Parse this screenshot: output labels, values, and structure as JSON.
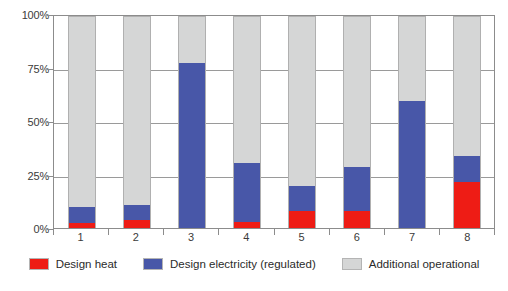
{
  "chart_data": {
    "type": "bar",
    "stacked": true,
    "title": "",
    "subtitle": "",
    "xlabel": "",
    "ylabel": "",
    "categories": [
      "1",
      "2",
      "3",
      "4",
      "5",
      "6",
      "7",
      "8"
    ],
    "ylim": [
      0,
      100
    ],
    "ytick_labels": [
      "0%",
      "25%",
      "50%",
      "75%",
      "100%"
    ],
    "ytick_values": [
      0,
      25,
      50,
      75,
      100
    ],
    "grid": true,
    "grid_axis": "y",
    "legend_position": "bottom",
    "series": [
      {
        "name": "Design heat",
        "color": "#ee1c15",
        "values": [
          2.5,
          4.0,
          0.0,
          3.0,
          8.0,
          8.0,
          0.0,
          22.0
        ]
      },
      {
        "name": "Design electricity (regulated)",
        "color": "#4857a8",
        "values": [
          7.5,
          7.0,
          78.0,
          28.0,
          12.0,
          21.0,
          60.0,
          12.0
        ]
      },
      {
        "name": "Additional operational",
        "color": "#d5d6d6",
        "values": [
          90.0,
          89.0,
          22.0,
          69.0,
          80.0,
          71.0,
          40.0,
          66.0
        ]
      }
    ],
    "cumulative_tops": {
      "design_heat": [
        2.5,
        4.0,
        0.0,
        3.0,
        8.0,
        8.0,
        0.0,
        22.0
      ],
      "design_electricity": [
        10.0,
        11.0,
        78.0,
        31.0,
        20.0,
        29.0,
        60.0,
        34.0
      ],
      "total": [
        100,
        100,
        100,
        100,
        100,
        100,
        100,
        100
      ]
    }
  },
  "legend": {
    "items": [
      {
        "label": "Design heat",
        "color": "#ee1c15"
      },
      {
        "label": "Design electricity (regulated)",
        "color": "#4857a8"
      },
      {
        "label": "Additional operational",
        "color": "#d5d6d6"
      }
    ]
  },
  "axes": {
    "y": {
      "labels": [
        "100%",
        "75%",
        "50%",
        "25%",
        "0%"
      ]
    },
    "x": {
      "labels": [
        "1",
        "2",
        "3",
        "4",
        "5",
        "6",
        "7",
        "8"
      ]
    }
  }
}
